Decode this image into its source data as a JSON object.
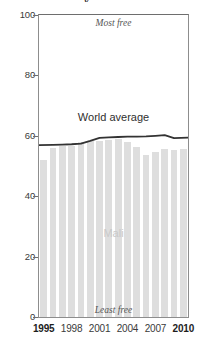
{
  "chart_data": {
    "type": "bar",
    "title": "",
    "xlabel": "",
    "ylabel": "",
    "ylim": [
      0,
      100
    ],
    "xlim": [
      1995,
      2010
    ],
    "grid": false,
    "legend_position": "inline-annotation",
    "categories": [
      "1995",
      "1996",
      "1997",
      "1998",
      "1999",
      "2000",
      "2001",
      "2002",
      "2003",
      "2004",
      "2005",
      "2006",
      "2007",
      "2008",
      "2009",
      "2010"
    ],
    "series": [
      {
        "name": "Mali",
        "type": "bar",
        "color": "#dedede",
        "values": [
          52.1,
          56.0,
          56.6,
          56.6,
          57.8,
          58.3,
          58.4,
          58.7,
          58.8,
          57.8,
          56.2,
          53.7,
          54.8,
          55.6,
          55.4,
          55.6
        ]
      },
      {
        "name": "World average",
        "type": "line",
        "color": "#333333",
        "values": [
          56.9,
          57.0,
          57.1,
          57.2,
          57.4,
          58.3,
          59.3,
          59.5,
          59.6,
          59.7,
          59.7,
          59.8,
          60.0,
          60.2,
          59.2,
          59.4
        ]
      }
    ],
    "y_ticks": [
      0,
      20,
      40,
      60,
      80,
      100
    ],
    "x_ticks": [
      "1995",
      "1998",
      "2001",
      "2004",
      "2007",
      "2010"
    ],
    "x_ticks_emphasis": [
      "1995",
      "2010"
    ],
    "annotations": {
      "top_scale": "Most free",
      "bottom_scale": "Least free",
      "line_label": "World average",
      "bar_label": "Mali"
    },
    "title_descender_fragment": "y"
  }
}
